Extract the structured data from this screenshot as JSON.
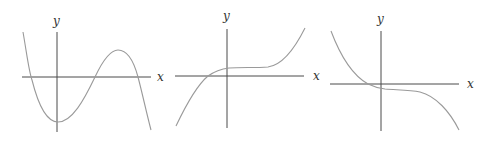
{
  "figure": {
    "colors": {
      "axis": "#4a4a4a",
      "curve": "#9a9a9a",
      "background": "#ffffff"
    },
    "graphs": [
      {
        "id": "graph-1",
        "x_label": "x",
        "y_label": "y",
        "shape": "cubic with negative leading coefficient; local min on y-axis below origin, local max right of origin above x-axis, three x-intercepts"
      },
      {
        "id": "graph-2",
        "x_label": "x",
        "y_label": "y",
        "shape": "increasing cubic with a flat inflection slightly above x-axis to the right of the y-axis; one x-intercept left of origin"
      },
      {
        "id": "graph-3",
        "x_label": "x",
        "y_label": "y",
        "shape": "decreasing cubic with a flat inflection slightly below x-axis to the right of the y-axis; one x-intercept left of origin"
      }
    ]
  }
}
